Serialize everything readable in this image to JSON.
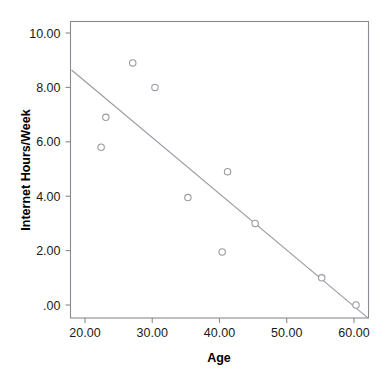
{
  "chart_data": {
    "type": "scatter",
    "title": "",
    "xlabel": "Age",
    "ylabel": "Internet Hours/Week",
    "xlim": [
      17.8,
      62.2
    ],
    "ylim": [
      -0.5,
      10.6
    ],
    "grid": false,
    "legend": null,
    "x_ticks": [
      20,
      30,
      40,
      50,
      60
    ],
    "x_tick_labels": [
      "20.00",
      "30.00",
      "40.00",
      "50.00",
      "60.00"
    ],
    "y_ticks": [
      0,
      2,
      4,
      6,
      8,
      10
    ],
    "y_tick_labels": [
      ".00",
      "2.00",
      "4.00",
      "6.00",
      "8.00",
      "10.00"
    ],
    "x": [
      22.4,
      23.1,
      27.1,
      30.4,
      35.3,
      40.4,
      41.2,
      45.3,
      55.2,
      60.3
    ],
    "y": [
      5.8,
      6.9,
      8.9,
      8.0,
      3.95,
      1.95,
      4.9,
      3.0,
      1.0,
      0.0
    ],
    "points": [
      {
        "x": 22.4,
        "y": 5.8
      },
      {
        "x": 23.1,
        "y": 6.9
      },
      {
        "x": 27.1,
        "y": 8.9
      },
      {
        "x": 30.4,
        "y": 8.0
      },
      {
        "x": 35.3,
        "y": 3.95
      },
      {
        "x": 40.4,
        "y": 1.95
      },
      {
        "x": 41.2,
        "y": 4.9
      },
      {
        "x": 45.3,
        "y": 3.0
      },
      {
        "x": 55.2,
        "y": 1.0
      },
      {
        "x": 60.3,
        "y": 0.0
      }
    ],
    "fit_line": {
      "name": "linear-fit",
      "x_start": 18.0,
      "y_start": 8.64,
      "x_end": 62.1,
      "y_end": -0.48
    },
    "marker_style": "open-circle",
    "colors": {
      "marker_stroke": "#9a9aa2",
      "marker_fill": "#ffffff",
      "fit_line": "#9a9aa2",
      "axis": "#8a8a92",
      "text": "#1a1a1a",
      "background": "#ffffff"
    }
  }
}
